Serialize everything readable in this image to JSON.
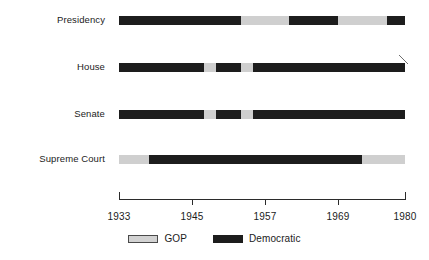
{
  "chart_data": {
    "type": "bar",
    "title": "",
    "subtitle": "",
    "xlabel": "",
    "ylabel": "",
    "orientation": "horizontal",
    "chart_style": "timeline-gantt",
    "grid": false,
    "legend_position": "bottom-center",
    "xlim": [
      1933,
      1980
    ],
    "x_axis_ticks": [
      1933,
      1945,
      1957,
      1969,
      1980
    ],
    "x_tick_labels": [
      "1933",
      "1945",
      "1957",
      "1969",
      "1980"
    ],
    "categories": [
      "Presidency",
      "House",
      "Senate",
      "Supreme Court"
    ],
    "legend": [
      {
        "name": "GOP",
        "color": "#cfcfcf"
      },
      {
        "name": "Democratic",
        "color": "#1d1d1d"
      }
    ],
    "rows": [
      {
        "label": "Presidency",
        "segments": [
          {
            "party": "Democratic",
            "start": 1933,
            "end": 1953
          },
          {
            "party": "GOP",
            "start": 1953,
            "end": 1961
          },
          {
            "party": "Democratic",
            "start": 1961,
            "end": 1969
          },
          {
            "party": "GOP",
            "start": 1969,
            "end": 1977
          },
          {
            "party": "Democratic",
            "start": 1977,
            "end": 1980
          }
        ]
      },
      {
        "label": "House",
        "segments": [
          {
            "party": "Democratic",
            "start": 1933,
            "end": 1947
          },
          {
            "party": "GOP",
            "start": 1947,
            "end": 1949
          },
          {
            "party": "Democratic",
            "start": 1949,
            "end": 1953
          },
          {
            "party": "GOP",
            "start": 1953,
            "end": 1955
          },
          {
            "party": "Democratic",
            "start": 1955,
            "end": 1980
          }
        ]
      },
      {
        "label": "Senate",
        "segments": [
          {
            "party": "Democratic",
            "start": 1933,
            "end": 1947
          },
          {
            "party": "GOP",
            "start": 1947,
            "end": 1949
          },
          {
            "party": "Democratic",
            "start": 1949,
            "end": 1953
          },
          {
            "party": "GOP",
            "start": 1953,
            "end": 1955
          },
          {
            "party": "Democratic",
            "start": 1955,
            "end": 1980
          }
        ]
      },
      {
        "label": "Supreme Court",
        "segments": [
          {
            "party": "GOP",
            "start": 1933,
            "end": 1938
          },
          {
            "party": "Democratic",
            "start": 1938,
            "end": 1973
          },
          {
            "party": "GOP",
            "start": 1973,
            "end": 1980
          }
        ]
      }
    ]
  },
  "colors": {
    "gop": "#cfcfcf",
    "democratic": "#1d1d1d",
    "axis": "#2b2b2b",
    "text": "#1b1b1b",
    "background": "#ffffff"
  },
  "layout": {
    "plot_left_px": 119,
    "plot_right_px": 405,
    "bar_height_px": 9,
    "row_y_px": [
      16,
      63,
      110,
      155
    ],
    "axis_y_px": 199
  }
}
